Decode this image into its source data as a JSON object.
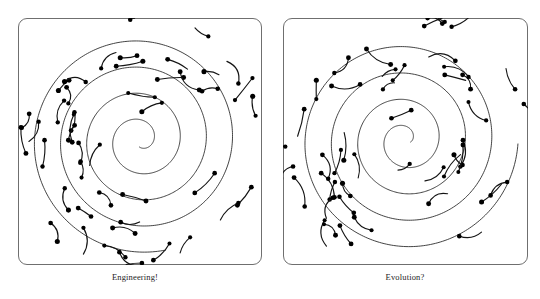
{
  "figure": {
    "background_color": "#ffffff",
    "ink_color": "#111111",
    "frame_color": "#6f6f6f"
  },
  "panels": [
    {
      "id": "left",
      "caption": "Engineering!",
      "frame": {
        "x": 18,
        "y": 18,
        "width": 244,
        "height": 247,
        "corner_radius": 9
      },
      "spiral": {
        "center_x": 122,
        "center_y": 122,
        "turns": 4.05,
        "start_radius": 7,
        "end_radius": 113,
        "phase_deg": 95,
        "direction": "counterclockwise"
      },
      "hook_count": 46,
      "hook_seed": 1337
    },
    {
      "id": "right",
      "caption": "Evolution?",
      "frame": {
        "x": 13,
        "y": 18,
        "width": 245,
        "height": 247,
        "corner_radius": 9
      },
      "spiral": {
        "center_x": 122,
        "center_y": 122,
        "turns": 4.05,
        "start_radius": 6,
        "end_radius": 113,
        "phase_deg": 20,
        "direction": "counterclockwise"
      },
      "hook_count": 46,
      "hook_seed": 90210
    }
  ],
  "chart_data": {
    "type": "scatter",
    "subtitle": "",
    "xlabel": "",
    "ylabel": "",
    "grid": false,
    "legend": "none",
    "series": [
      {
        "name": "Engineering! spiral backbone",
        "panel": "left",
        "kind": "archimedean-spiral",
        "turns": 4.05,
        "r_min": 7,
        "r_max": 113,
        "center": [
          122,
          122
        ]
      },
      {
        "name": "Engineering! hooks",
        "panel": "left",
        "kind": "curved-segments-with-endpoint-dots",
        "count": 46
      },
      {
        "name": "Evolution? spiral backbone",
        "panel": "right",
        "kind": "archimedean-spiral",
        "turns": 4.05,
        "r_min": 6,
        "r_max": 113,
        "center": [
          122,
          122
        ]
      },
      {
        "name": "Evolution? hooks",
        "panel": "right",
        "kind": "curved-segments-with-endpoint-dots",
        "count": 46
      }
    ]
  }
}
